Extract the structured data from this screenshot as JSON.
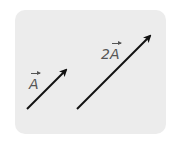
{
  "diagram": {
    "background_color": "#ececec",
    "arrow_color": "#111111",
    "label_color": "#555555",
    "vectors": [
      {
        "id": "A",
        "label_coefficient": "",
        "label_symbol": "A",
        "tail": [
          27,
          109
        ],
        "tip": [
          67,
          69
        ]
      },
      {
        "id": "2A",
        "label_coefficient": "2",
        "label_symbol": "A",
        "tail": [
          77,
          109
        ],
        "tip": [
          151,
          35
        ]
      }
    ]
  }
}
